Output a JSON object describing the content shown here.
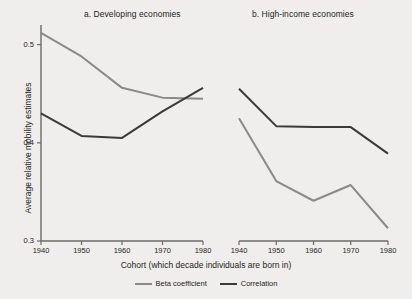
{
  "figure": {
    "background_color": "#efeeec",
    "ylabel": "Average relative mobility estimates",
    "xlabel": "Cohort (which decade individuals are born in)"
  },
  "legend": {
    "entries": [
      {
        "label": "Beta coefficient",
        "color": "#8a8a8a"
      },
      {
        "label": "Correlation",
        "color": "#3a3a3a"
      }
    ]
  },
  "chart_data": [
    {
      "type": "line",
      "title": "a. Developing economies",
      "xlabel": "Cohort (which decade individuals are born in)",
      "ylabel": "Average relative mobility estimates",
      "x": [
        1940,
        1950,
        1960,
        1970,
        1980
      ],
      "xticklabels": [
        "1940",
        "1950",
        "1960",
        "1970",
        "1980"
      ],
      "yticks": [
        0.3,
        0.4,
        0.5
      ],
      "yticklabels": [
        "0.3",
        "0.4",
        "0.5"
      ],
      "ylim": [
        0.3,
        0.52
      ],
      "xlim": [
        1938,
        1982
      ],
      "grid": false,
      "legend_position": "bottom-center",
      "series": [
        {
          "name": "Beta coefficient",
          "color": "#8a8a8a",
          "values": [
            0.512,
            0.488,
            0.456,
            0.446,
            0.445
          ]
        },
        {
          "name": "Correlation",
          "color": "#3a3a3a",
          "values": [
            0.43,
            0.407,
            0.405,
            0.432,
            0.456
          ]
        }
      ]
    },
    {
      "type": "line",
      "title": "b. High-income economies",
      "xlabel": "Cohort (which decade individuals are born in)",
      "ylabel": "Average relative mobility estimates",
      "x": [
        1940,
        1950,
        1960,
        1970,
        1980
      ],
      "xticklabels": [
        "1940",
        "1950",
        "1960",
        "1970",
        "1980"
      ],
      "yticks": [
        0.3,
        0.4,
        0.5
      ],
      "yticklabels": [
        "0.3",
        "0.4",
        "0.5"
      ],
      "ylim": [
        0.3,
        0.52
      ],
      "xlim": [
        1938,
        1982
      ],
      "grid": false,
      "legend_position": "bottom-center",
      "series": [
        {
          "name": "Beta coefficient",
          "color": "#8a8a8a",
          "values": [
            0.425,
            0.361,
            0.341,
            0.357,
            0.313
          ]
        },
        {
          "name": "Correlation",
          "color": "#3a3a3a",
          "values": [
            0.455,
            0.417,
            0.416,
            0.416,
            0.389
          ]
        }
      ]
    }
  ]
}
